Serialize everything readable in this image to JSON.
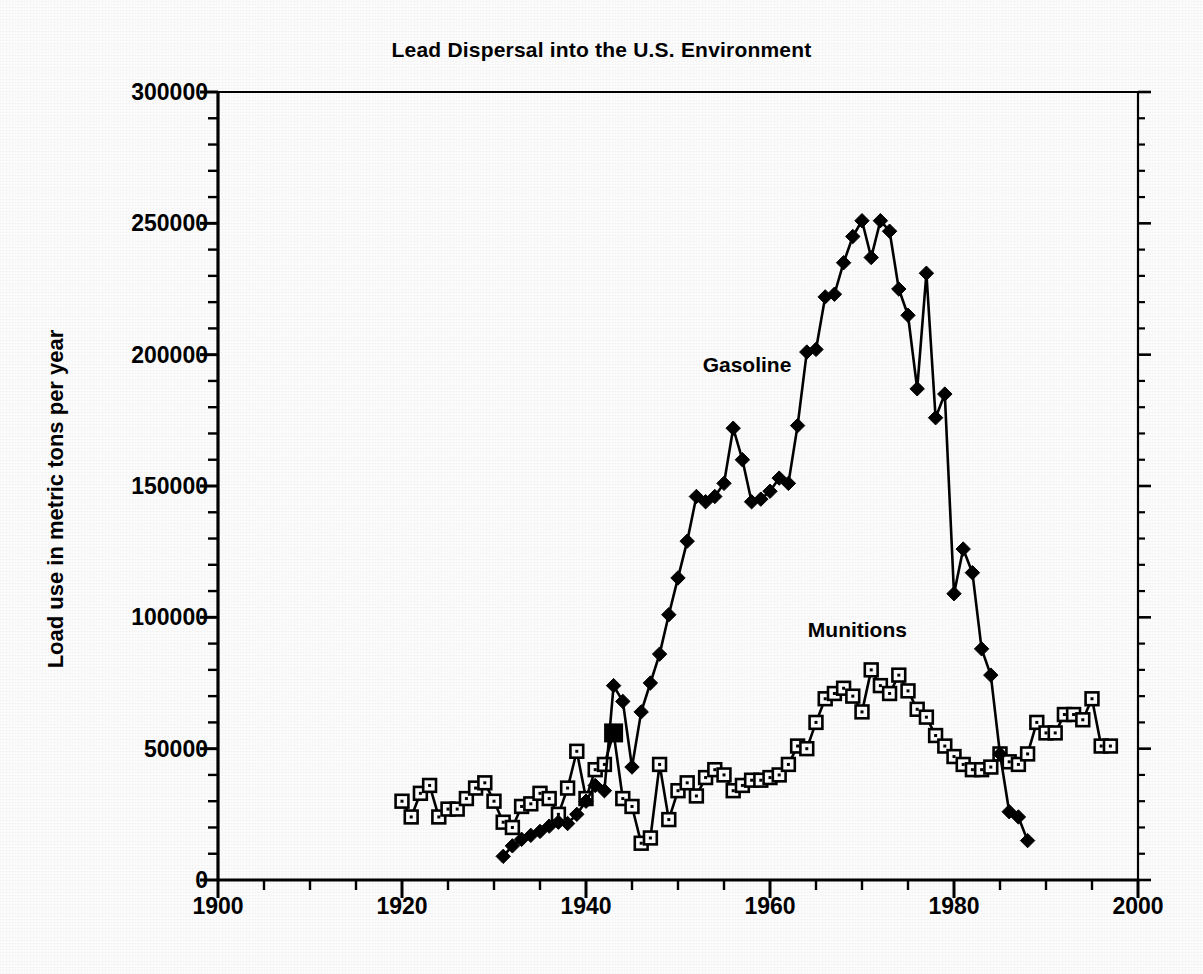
{
  "chart_data": {
    "type": "line",
    "title": "Lead Dispersal into the U.S. Environment",
    "xlabel": "",
    "ylabel": "Load use in metric tons per year",
    "xlim": [
      1900,
      2000
    ],
    "ylim": [
      0,
      300000
    ],
    "x_ticks": [
      1900,
      1920,
      1940,
      1960,
      1980,
      2000
    ],
    "x_tick_labels": [
      "1900",
      "1920",
      "1940",
      "1960",
      "1980",
      "2000"
    ],
    "x_minor_tick_step": 5,
    "y_ticks": [
      0,
      50000,
      100000,
      150000,
      200000,
      250000,
      300000
    ],
    "y_tick_labels": [
      "0",
      "50000",
      "100000",
      "150000",
      "200000",
      "250000",
      "300000"
    ],
    "y_minor_tick_step": 10000,
    "grid": false,
    "legend_position": "inline-annotations",
    "annotations": [
      {
        "text": "Gasoline",
        "x": 1957.5,
        "y": 196000
      },
      {
        "text": "Munitions",
        "x": 1969.5,
        "y": 95000
      }
    ],
    "series": [
      {
        "name": "Gasoline",
        "marker": "filled-diamond",
        "color": "#000000",
        "points": [
          [
            1931,
            9000
          ],
          [
            1932,
            13000
          ],
          [
            1933,
            15500
          ],
          [
            1934,
            17000
          ],
          [
            1935,
            18500
          ],
          [
            1936,
            20500
          ],
          [
            1937,
            22000
          ],
          [
            1938,
            21500
          ],
          [
            1939,
            25000
          ],
          [
            1940,
            30000
          ],
          [
            1941,
            36000
          ],
          [
            1942,
            34000
          ],
          [
            1943,
            74000
          ],
          [
            1944,
            68000
          ],
          [
            1945,
            43000
          ],
          [
            1946,
            64000
          ],
          [
            1947,
            75000
          ],
          [
            1948,
            86000
          ],
          [
            1949,
            101000
          ],
          [
            1950,
            115000
          ],
          [
            1951,
            129000
          ],
          [
            1952,
            146000
          ],
          [
            1953,
            144000
          ],
          [
            1954,
            146000
          ],
          [
            1955,
            151000
          ],
          [
            1956,
            172000
          ],
          [
            1957,
            160000
          ],
          [
            1958,
            144000
          ],
          [
            1959,
            145000
          ],
          [
            1960,
            148000
          ],
          [
            1961,
            153000
          ],
          [
            1962,
            151000
          ],
          [
            1963,
            173000
          ],
          [
            1964,
            201000
          ],
          [
            1965,
            202000
          ],
          [
            1966,
            222000
          ],
          [
            1967,
            223000
          ],
          [
            1968,
            235000
          ],
          [
            1969,
            245000
          ],
          [
            1970,
            251000
          ],
          [
            1971,
            237000
          ],
          [
            1972,
            251000
          ],
          [
            1973,
            247000
          ],
          [
            1974,
            225000
          ],
          [
            1975,
            215000
          ],
          [
            1976,
            187000
          ],
          [
            1977,
            231000
          ],
          [
            1978,
            176000
          ],
          [
            1979,
            185000
          ],
          [
            1980,
            109000
          ],
          [
            1981,
            126000
          ],
          [
            1982,
            117000
          ],
          [
            1983,
            88000
          ],
          [
            1984,
            78000
          ],
          [
            1985,
            48000
          ],
          [
            1986,
            26000
          ],
          [
            1987,
            24000
          ],
          [
            1988,
            15000
          ]
        ]
      },
      {
        "name": "Munitions",
        "marker": "open-square",
        "color": "#000000",
        "points": [
          [
            1920,
            30000
          ],
          [
            1921,
            24000
          ],
          [
            1922,
            33000
          ],
          [
            1923,
            36000
          ],
          [
            1924,
            24000
          ],
          [
            1925,
            27000
          ],
          [
            1926,
            27000
          ],
          [
            1927,
            31000
          ],
          [
            1928,
            35000
          ],
          [
            1929,
            37000
          ],
          [
            1930,
            30000
          ],
          [
            1931,
            22000
          ],
          [
            1932,
            20000
          ],
          [
            1933,
            28000
          ],
          [
            1934,
            29000
          ],
          [
            1935,
            33000
          ],
          [
            1936,
            31000
          ],
          [
            1937,
            25000
          ],
          [
            1938,
            35000
          ],
          [
            1939,
            49000
          ],
          [
            1940,
            31000
          ],
          [
            1941,
            42000
          ],
          [
            1942,
            44000
          ],
          [
            1943,
            56000
          ],
          [
            1944,
            31000
          ],
          [
            1945,
            28000
          ],
          [
            1946,
            14000
          ],
          [
            1947,
            16000
          ],
          [
            1948,
            44000
          ],
          [
            1949,
            23000
          ],
          [
            1950,
            34000
          ],
          [
            1951,
            37000
          ],
          [
            1952,
            32000
          ],
          [
            1953,
            39000
          ],
          [
            1954,
            42000
          ],
          [
            1955,
            40000
          ],
          [
            1956,
            34000
          ],
          [
            1957,
            36000
          ],
          [
            1958,
            38000
          ],
          [
            1959,
            38000
          ],
          [
            1960,
            39000
          ],
          [
            1961,
            40000
          ],
          [
            1962,
            44000
          ],
          [
            1963,
            51000
          ],
          [
            1964,
            50000
          ],
          [
            1965,
            60000
          ],
          [
            1966,
            69000
          ],
          [
            1967,
            71000
          ],
          [
            1968,
            73000
          ],
          [
            1969,
            70000
          ],
          [
            1970,
            64000
          ],
          [
            1971,
            80000
          ],
          [
            1972,
            74000
          ],
          [
            1973,
            71000
          ],
          [
            1974,
            78000
          ],
          [
            1975,
            72000
          ],
          [
            1976,
            65000
          ],
          [
            1977,
            62000
          ],
          [
            1978,
            55000
          ],
          [
            1979,
            51000
          ],
          [
            1980,
            47000
          ],
          [
            1981,
            44000
          ],
          [
            1982,
            42000
          ],
          [
            1983,
            42000
          ],
          [
            1984,
            43000
          ],
          [
            1985,
            48000
          ],
          [
            1986,
            45000
          ],
          [
            1987,
            44000
          ],
          [
            1988,
            48000
          ],
          [
            1989,
            60000
          ],
          [
            1990,
            56000
          ],
          [
            1991,
            56000
          ],
          [
            1992,
            63000
          ],
          [
            1993,
            63000
          ],
          [
            1994,
            61000
          ],
          [
            1995,
            69000
          ],
          [
            1996,
            51000
          ],
          [
            1997,
            51000
          ]
        ]
      }
    ]
  }
}
